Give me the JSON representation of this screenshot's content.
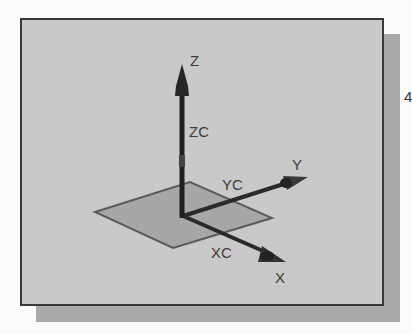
{
  "diagram": {
    "title": "",
    "axes": {
      "z": {
        "label": "Z",
        "work_label": "ZC"
      },
      "y": {
        "label": "Y",
        "work_label": "YC"
      },
      "x": {
        "label": "X",
        "work_label": "XC"
      }
    },
    "plane": {
      "name": "XC-YC plane"
    },
    "edge_text": "4"
  },
  "colors": {
    "background": "#fbfbfb",
    "panel": "#c9c9c9",
    "panel_border": "#3a3a3a",
    "shadow": "#a9a9a9",
    "axis": "#2a2a2a",
    "plane_fill": "#a6a6a6",
    "plane_edge": "#555555",
    "label": "#3c3c3c"
  }
}
